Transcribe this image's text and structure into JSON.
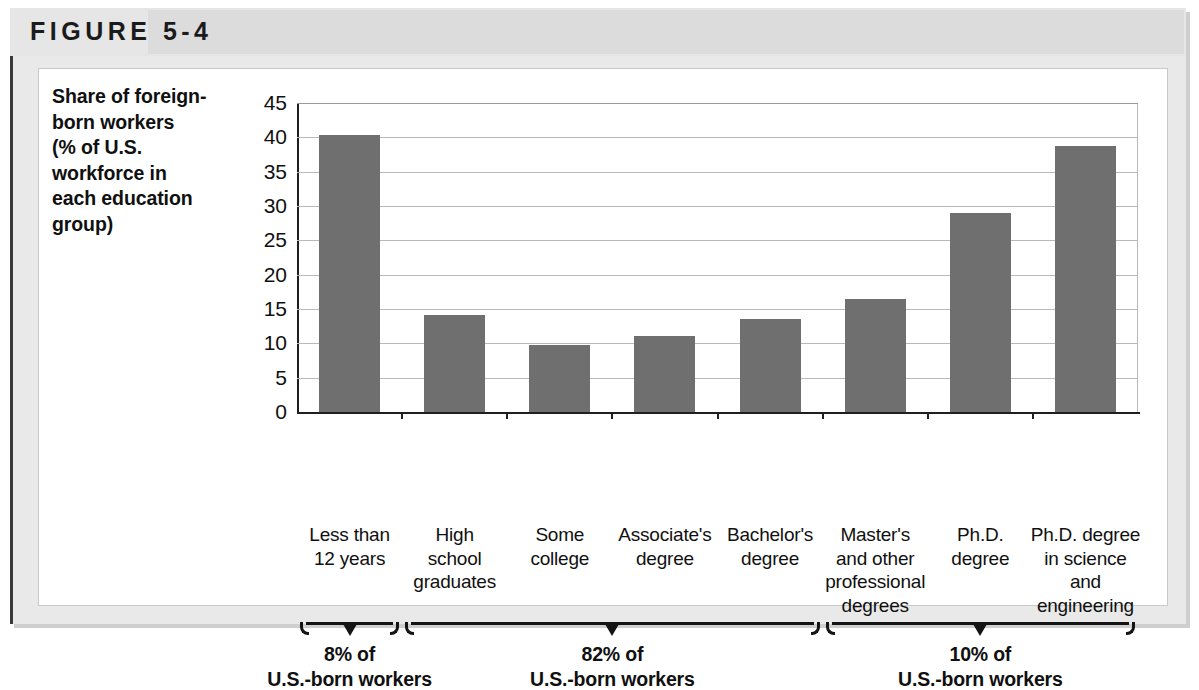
{
  "figure": {
    "label": "FIGURE 5-4"
  },
  "chart_data": {
    "type": "bar",
    "title": "",
    "ylabel": "Share of foreign-born workers (% of U.S. workforce in each education group)",
    "ylabel_lines": [
      "Share of foreign-",
      "born workers",
      "(% of U.S.",
      "workforce in",
      "each education",
      "group)"
    ],
    "xlabel": "",
    "ylim": [
      0,
      45
    ],
    "ytick_values": [
      0,
      5,
      10,
      15,
      20,
      25,
      30,
      35,
      40,
      45
    ],
    "ytick_labels": [
      "0",
      "5",
      "10",
      "15",
      "20",
      "25",
      "30",
      "35",
      "40",
      "45"
    ],
    "grid": true,
    "legend": "none",
    "bar_color": "#6f6f6f",
    "categories": [
      "Less than 12 years",
      "High school graduates",
      "Some college",
      "Associate's degree",
      "Bachelor's degree",
      "Master's and other professional degrees",
      "Ph.D. degree",
      "Ph.D. degree in science and engineering"
    ],
    "category_lines": [
      [
        "Less than",
        "12 years"
      ],
      [
        "High",
        "school",
        "graduates"
      ],
      [
        "Some",
        "college"
      ],
      [
        "Associate's",
        "degree"
      ],
      [
        "Bachelor's",
        "degree"
      ],
      [
        "Master's",
        "and other",
        "professional",
        "degrees"
      ],
      [
        "Ph.D.",
        "degree"
      ],
      [
        "Ph.D. degree",
        "in science",
        "and",
        "engineering"
      ]
    ],
    "values": [
      40.3,
      14.2,
      9.7,
      11.0,
      13.5,
      16.4,
      29.0,
      38.8
    ],
    "annotations": [
      {
        "id": "group-less-than-hs",
        "percent": "8% of",
        "text": "U.S.-born workers",
        "covers_categories": [
          0
        ]
      },
      {
        "id": "group-middle",
        "percent": "82% of",
        "text": "U.S.-born workers",
        "covers_categories": [
          1,
          2,
          3,
          4
        ]
      },
      {
        "id": "group-advanced",
        "percent": "10% of",
        "text": "U.S.-born workers",
        "covers_categories": [
          5,
          6,
          7
        ]
      }
    ]
  }
}
